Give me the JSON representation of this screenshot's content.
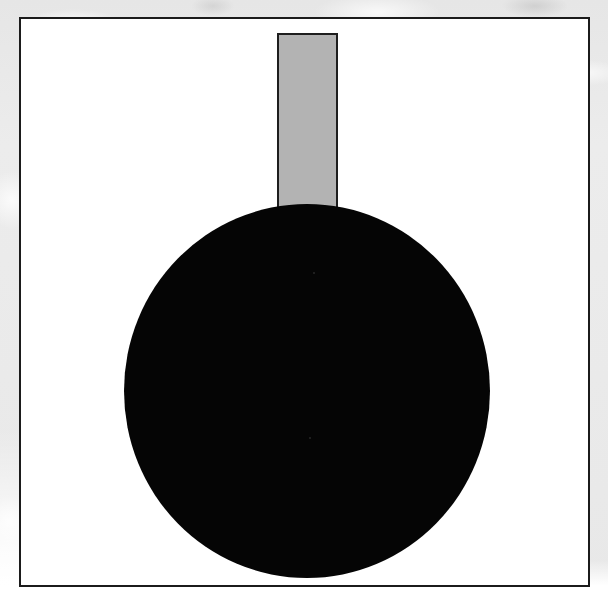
{
  "page": {
    "width": 608,
    "height": 606,
    "background": "#ffffff",
    "scan_margin_color": "#e9e9e9"
  },
  "frame": {
    "name": "figure-border",
    "x": 19,
    "y": 17,
    "width": 571,
    "height": 570,
    "stroke_color": "#1b1b1b",
    "stroke_width": 2,
    "fill_color": "#ffffff"
  },
  "figure": {
    "title": "",
    "caption": "",
    "shapes": [
      {
        "id": "stem",
        "type": "rectangle",
        "label": "vertical stem",
        "x": 277,
        "y": 33,
        "width": 61,
        "height": 182,
        "fill_color": "#b3b3b3",
        "stroke_color": "#1e1e1e",
        "stroke_width": 2,
        "z_order": 1
      },
      {
        "id": "disc",
        "type": "circle",
        "label": "solid black disc",
        "center_x": 307,
        "center_y": 391,
        "radius_x": 183,
        "radius_y": 187,
        "fill_color": "#050505",
        "stroke_color": "none",
        "stroke_width": 0,
        "z_order": 2
      }
    ],
    "specks": [
      {
        "x": 313,
        "y": 272
      },
      {
        "x": 309,
        "y": 437
      }
    ]
  }
}
